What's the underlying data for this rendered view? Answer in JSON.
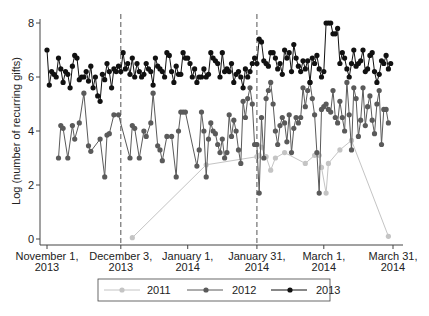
{
  "chart_data": {
    "type": "line",
    "title": "",
    "xlabel": "",
    "ylabel": "Log (number of recurring gifts)",
    "ylim": [
      0,
      8
    ],
    "yticks": [
      0,
      2,
      4,
      6,
      8
    ],
    "xrange_days": [
      0,
      150
    ],
    "xticks": [
      {
        "day": 0,
        "label": [
          "November 1,",
          "2013"
        ]
      },
      {
        "day": 32,
        "label": [
          "December 3,",
          "2013"
        ]
      },
      {
        "day": 61,
        "label": [
          "January 1,",
          "2014"
        ]
      },
      {
        "day": 91,
        "label": [
          "January 31,",
          "2014"
        ]
      },
      {
        "day": 120,
        "label": [
          "March 1,",
          "2014"
        ]
      },
      {
        "day": 150,
        "label": [
          "March 31,",
          "2014"
        ]
      }
    ],
    "vlines_days": [
      32,
      91
    ],
    "grid": false,
    "legend_position": "bottom",
    "series": [
      {
        "name": "2011",
        "color": "#c4c4c4",
        "points": [
          [
            37,
            0.05
          ],
          [
            69,
            2.75
          ],
          [
            91,
            3.05
          ],
          [
            92,
            3.1
          ],
          [
            93,
            3.4
          ],
          [
            95,
            3.05
          ],
          [
            97,
            2.55
          ],
          [
            99,
            3.0
          ],
          [
            103,
            3.2
          ],
          [
            112,
            2.8
          ],
          [
            116,
            3.1
          ],
          [
            118,
            3.1
          ],
          [
            119,
            2.65
          ],
          [
            121,
            1.7
          ],
          [
            122,
            2.8
          ],
          [
            127,
            3.3
          ],
          [
            132,
            3.65
          ],
          [
            148,
            0.1
          ]
        ]
      },
      {
        "name": "2012",
        "color": "#5a5a5a",
        "points": [
          [
            5,
            3.0
          ],
          [
            6,
            4.2
          ],
          [
            7,
            4.1
          ],
          [
            9,
            3.0
          ],
          [
            11,
            4.2
          ],
          [
            12,
            3.7
          ],
          [
            14,
            4.3
          ],
          [
            16,
            5.4
          ],
          [
            18,
            3.45
          ],
          [
            19,
            3.25
          ],
          [
            23,
            3.7
          ],
          [
            25,
            2.3
          ],
          [
            26,
            3.85
          ],
          [
            27,
            3.9
          ],
          [
            29,
            4.6
          ],
          [
            31,
            4.6
          ],
          [
            36,
            3.0
          ],
          [
            37,
            4.2
          ],
          [
            38,
            4.1
          ],
          [
            40,
            3.0
          ],
          [
            42,
            4.0
          ],
          [
            43,
            3.8
          ],
          [
            45,
            4.3
          ],
          [
            46,
            5.4
          ],
          [
            48,
            3.45
          ],
          [
            49,
            3.3
          ],
          [
            50,
            2.9
          ],
          [
            52,
            3.8
          ],
          [
            54,
            3.8
          ],
          [
            56,
            2.3
          ],
          [
            57,
            4.0
          ],
          [
            58,
            4.7
          ],
          [
            59,
            4.7
          ],
          [
            60,
            4.7
          ],
          [
            65,
            2.7
          ],
          [
            66,
            3.3
          ],
          [
            67,
            4.7
          ],
          [
            68,
            4.0
          ],
          [
            69,
            2.3
          ],
          [
            70,
            3.7
          ],
          [
            71,
            4.3
          ],
          [
            72,
            4.0
          ],
          [
            73,
            3.9
          ],
          [
            74,
            3.5
          ],
          [
            75,
            3.2
          ],
          [
            76,
            3.7
          ],
          [
            77,
            3.0
          ],
          [
            78,
            3.2
          ],
          [
            79,
            4.6
          ],
          [
            80,
            3.8
          ],
          [
            81,
            4.4
          ],
          [
            82,
            4.0
          ],
          [
            83,
            3.3
          ],
          [
            84,
            2.8
          ],
          [
            85,
            5.1
          ],
          [
            86,
            4.5
          ],
          [
            87,
            5.2
          ],
          [
            88,
            5.6
          ],
          [
            89,
            5.0
          ],
          [
            90,
            3.5
          ],
          [
            91,
            3.5
          ],
          [
            92,
            1.7
          ],
          [
            93,
            4.5
          ],
          [
            94,
            3.0
          ],
          [
            95,
            5.2
          ],
          [
            96,
            5.5
          ],
          [
            97,
            5.8
          ],
          [
            98,
            5.0
          ],
          [
            99,
            4.0
          ],
          [
            100,
            3.5
          ],
          [
            101,
            4.2
          ],
          [
            102,
            4.5
          ],
          [
            103,
            4.3
          ],
          [
            104,
            3.6
          ],
          [
            105,
            4.6
          ],
          [
            106,
            3.2
          ],
          [
            107,
            4.1
          ],
          [
            108,
            4.5
          ],
          [
            109,
            4.3
          ],
          [
            110,
            4.5
          ],
          [
            111,
            5.6
          ],
          [
            112,
            4.9
          ],
          [
            113,
            5.5
          ],
          [
            114,
            5.8
          ],
          [
            115,
            5.2
          ],
          [
            116,
            4.6
          ],
          [
            117,
            3.2
          ],
          [
            118,
            1.7
          ],
          [
            119,
            4.8
          ],
          [
            120,
            4.9
          ],
          [
            121,
            5.0
          ],
          [
            122,
            4.8
          ],
          [
            123,
            4.7
          ],
          [
            124,
            5.5
          ],
          [
            125,
            4.5
          ],
          [
            126,
            4.3
          ],
          [
            127,
            5.1
          ],
          [
            128,
            4.5
          ],
          [
            129,
            4.0
          ],
          [
            130,
            5.8
          ],
          [
            131,
            4.6
          ],
          [
            132,
            3.3
          ],
          [
            133,
            5.6
          ],
          [
            134,
            5.2
          ],
          [
            135,
            3.8
          ],
          [
            136,
            4.4
          ],
          [
            137,
            5.6
          ],
          [
            138,
            4.2
          ],
          [
            139,
            4.9
          ],
          [
            140,
            5.3
          ],
          [
            141,
            4.4
          ],
          [
            142,
            3.9
          ],
          [
            143,
            5.0
          ],
          [
            144,
            5.5
          ],
          [
            145,
            3.5
          ],
          [
            146,
            4.8
          ],
          [
            147,
            4.8
          ],
          [
            148,
            4.3
          ]
        ]
      },
      {
        "name": "2013",
        "color": "#111111",
        "points": [
          [
            0,
            7.0
          ],
          [
            1,
            5.7
          ],
          [
            2,
            6.2
          ],
          [
            3,
            6.1
          ],
          [
            4,
            6.0
          ],
          [
            5,
            6.7
          ],
          [
            6,
            6.3
          ],
          [
            7,
            5.8
          ],
          [
            8,
            6.2
          ],
          [
            9,
            6.1
          ],
          [
            10,
            5.6
          ],
          [
            11,
            6.4
          ],
          [
            12,
            6.8
          ],
          [
            13,
            6.7
          ],
          [
            14,
            5.9
          ],
          [
            15,
            6.0
          ],
          [
            16,
            6.0
          ],
          [
            17,
            6.2
          ],
          [
            18,
            5.85
          ],
          [
            19,
            6.4
          ],
          [
            20,
            5.6
          ],
          [
            21,
            6.0
          ],
          [
            22,
            5.3
          ],
          [
            23,
            5.1
          ],
          [
            24,
            6.1
          ],
          [
            25,
            5.9
          ],
          [
            26,
            6.5
          ],
          [
            27,
            6.2
          ],
          [
            28,
            5.6
          ],
          [
            29,
            6.3
          ],
          [
            30,
            6.2
          ],
          [
            31,
            6.4
          ],
          [
            32,
            6.2
          ],
          [
            33,
            6.9
          ],
          [
            34,
            6.3
          ],
          [
            35,
            6.5
          ],
          [
            36,
            6.1
          ],
          [
            37,
            6.7
          ],
          [
            38,
            6.0
          ],
          [
            39,
            6.5
          ],
          [
            40,
            6.2
          ],
          [
            41,
            6.0
          ],
          [
            42,
            6.1
          ],
          [
            43,
            6.5
          ],
          [
            44,
            6.3
          ],
          [
            45,
            6.2
          ],
          [
            46,
            5.7
          ],
          [
            47,
            6.7
          ],
          [
            48,
            6.4
          ],
          [
            49,
            6.3
          ],
          [
            50,
            6.2
          ],
          [
            51,
            6.0
          ],
          [
            52,
            6.9
          ],
          [
            53,
            6.8
          ],
          [
            54,
            6.2
          ],
          [
            55,
            5.8
          ],
          [
            56,
            6.4
          ],
          [
            57,
            6.1
          ],
          [
            58,
            6.1
          ],
          [
            59,
            6.9
          ],
          [
            60,
            6.7
          ],
          [
            61,
            6.7
          ],
          [
            62,
            6.5
          ],
          [
            63,
            6.0
          ],
          [
            64,
            6.3
          ],
          [
            65,
            5.8
          ],
          [
            66,
            6.0
          ],
          [
            67,
            6.0
          ],
          [
            68,
            6.3
          ],
          [
            69,
            6.0
          ],
          [
            70,
            6.1
          ],
          [
            71,
            6.9
          ],
          [
            72,
            6.7
          ],
          [
            73,
            6.6
          ],
          [
            74,
            6.5
          ],
          [
            75,
            6.0
          ],
          [
            76,
            6.9
          ],
          [
            77,
            6.2
          ],
          [
            78,
            6.3
          ],
          [
            79,
            6.2
          ],
          [
            80,
            6.5
          ],
          [
            81,
            5.8
          ],
          [
            82,
            6.1
          ],
          [
            83,
            6.2
          ],
          [
            84,
            6.0
          ],
          [
            85,
            5.6
          ],
          [
            86,
            6.3
          ],
          [
            87,
            6.0
          ],
          [
            88,
            6.2
          ],
          [
            89,
            6.5
          ],
          [
            90,
            6.7
          ],
          [
            91,
            6.5
          ],
          [
            92,
            7.4
          ],
          [
            93,
            7.3
          ],
          [
            94,
            6.6
          ],
          [
            95,
            6.5
          ],
          [
            96,
            6.4
          ],
          [
            97,
            6.9
          ],
          [
            98,
            6.9
          ],
          [
            99,
            6.7
          ],
          [
            100,
            6.3
          ],
          [
            101,
            6.5
          ],
          [
            102,
            6.1
          ],
          [
            103,
            7.0
          ],
          [
            104,
            6.7
          ],
          [
            105,
            6.9
          ],
          [
            106,
            6.2
          ],
          [
            107,
            7.2
          ],
          [
            108,
            6.7
          ],
          [
            109,
            6.4
          ],
          [
            110,
            6.2
          ],
          [
            111,
            6.6
          ],
          [
            112,
            6.3
          ],
          [
            113,
            6.6
          ],
          [
            114,
            5.8
          ],
          [
            115,
            6.7
          ],
          [
            116,
            6.5
          ],
          [
            117,
            6.8
          ],
          [
            118,
            6.3
          ],
          [
            119,
            6.0
          ],
          [
            120,
            6.2
          ],
          [
            121,
            8.0
          ],
          [
            122,
            8.0
          ],
          [
            123,
            8.0
          ],
          [
            124,
            7.6
          ],
          [
            125,
            7.6
          ],
          [
            126,
            7.8
          ],
          [
            127,
            6.5
          ],
          [
            128,
            6.9
          ],
          [
            129,
            6.7
          ],
          [
            130,
            6.3
          ],
          [
            131,
            6.0
          ],
          [
            132,
            6.5
          ],
          [
            133,
            7.0
          ],
          [
            134,
            6.4
          ],
          [
            135,
            6.5
          ],
          [
            136,
            6.6
          ],
          [
            137,
            7.0
          ],
          [
            138,
            6.2
          ],
          [
            139,
            6.3
          ],
          [
            140,
            6.8
          ],
          [
            141,
            6.9
          ],
          [
            142,
            6.2
          ],
          [
            143,
            5.8
          ],
          [
            144,
            6.1
          ],
          [
            145,
            6.6
          ],
          [
            146,
            6.5
          ],
          [
            147,
            6.8
          ],
          [
            148,
            6.3
          ],
          [
            149,
            6.5
          ]
        ]
      }
    ]
  },
  "legend": {
    "items": [
      {
        "label": "2011",
        "color": "#c4c4c4"
      },
      {
        "label": "2012",
        "color": "#5a5a5a"
      },
      {
        "label": "2013",
        "color": "#111111"
      }
    ]
  }
}
